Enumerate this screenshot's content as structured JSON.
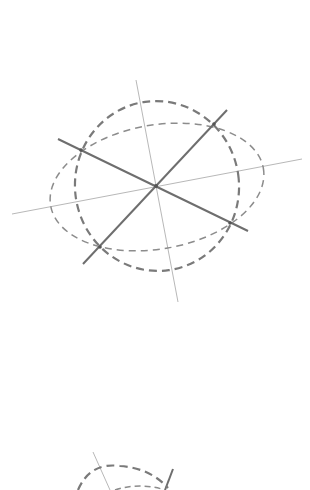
{
  "diagram": {
    "colors": {
      "background": "#ffffff",
      "thin_axis": "#b8b8b8",
      "solid_line": "#6e6e6e",
      "dashed_circle": "#7a7a7a",
      "dashed_ellipse": "#8c8c8c"
    },
    "figure1": {
      "center": [
        156,
        186
      ],
      "axis_long": {
        "x1": 12,
        "y1": 214,
        "x2": 302,
        "y2": 159
      },
      "axis_short": {
        "x1": 136,
        "y1": 80,
        "x2": 178,
        "y2": 302
      },
      "diameter_a": {
        "x1": 58,
        "y1": 139,
        "x2": 248,
        "y2": 231
      },
      "diameter_b": {
        "x1": 83,
        "y1": 264,
        "x2": 227,
        "y2": 110
      },
      "circle": {
        "cx": 157,
        "cy": 186,
        "rx": 82,
        "ry": 85,
        "rotation": -8
      },
      "ellipse": {
        "cx": 157,
        "cy": 187,
        "rx": 108,
        "ry": 62,
        "rotation": -10
      },
      "intersection_points": [
        [
          214,
          124
        ],
        [
          81,
          150
        ],
        [
          100,
          247
        ],
        [
          230,
          223
        ]
      ]
    },
    "figure2_partial": {
      "thin_line": {
        "x1": 93,
        "y1": 452,
        "x2": 110,
        "y2": 490
      },
      "solid_line": {
        "x1": 173,
        "y1": 469,
        "x2": 165,
        "y2": 490
      },
      "dashed_arc_outer": "M 78 490 Q 90 462 120 466 Q 150 468 168 488",
      "dashed_arc_inner": "M 115 490 Q 140 482 165 490"
    }
  }
}
